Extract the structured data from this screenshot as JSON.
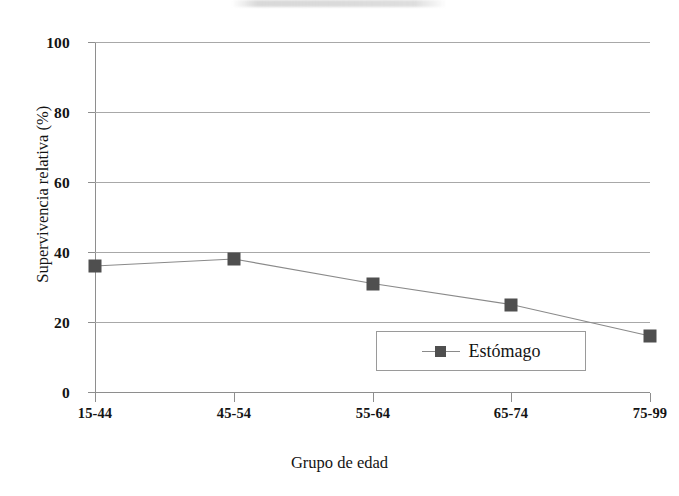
{
  "chart_data": {
    "type": "line",
    "title": "",
    "xlabel": "Grupo de edad",
    "ylabel": "Supervivencia relativa (%)",
    "categories": [
      "15-44",
      "45-54",
      "55-64",
      "65-74",
      "75-99"
    ],
    "series": [
      {
        "name": "Estómago",
        "values": [
          36,
          38,
          31,
          25,
          16
        ],
        "marker": "square",
        "color": "#4f4f4f"
      }
    ],
    "ylim": [
      0,
      100
    ],
    "yticks": [
      0,
      20,
      40,
      60,
      80,
      100
    ],
    "ytick_labels": [
      "0",
      "20",
      "40",
      "60",
      "80",
      "100"
    ],
    "grid": true,
    "grid_axis": "y",
    "legend_position": "inside-bottom-center",
    "legend_entries": [
      "Estómago"
    ]
  },
  "axes": {
    "y_title": "Supervivencia relativa (%)",
    "x_title": "Grupo de edad",
    "y_labels": {
      "t0": "0",
      "t20": "20",
      "t40": "40",
      "t60": "60",
      "t80": "80",
      "t100": "100"
    },
    "x_labels": {
      "c0": "15-44",
      "c1": "45-54",
      "c2": "55-64",
      "c3": "65-74",
      "c4": "75-99"
    }
  },
  "legend": {
    "entry_label": "Estómago"
  },
  "colors": {
    "marker": "#4f4f4f",
    "line": "#8a8a8a",
    "gridline": "#a8a8a8",
    "axis": "#8e8e8e",
    "text": "#141414",
    "background": "#ffffff"
  }
}
